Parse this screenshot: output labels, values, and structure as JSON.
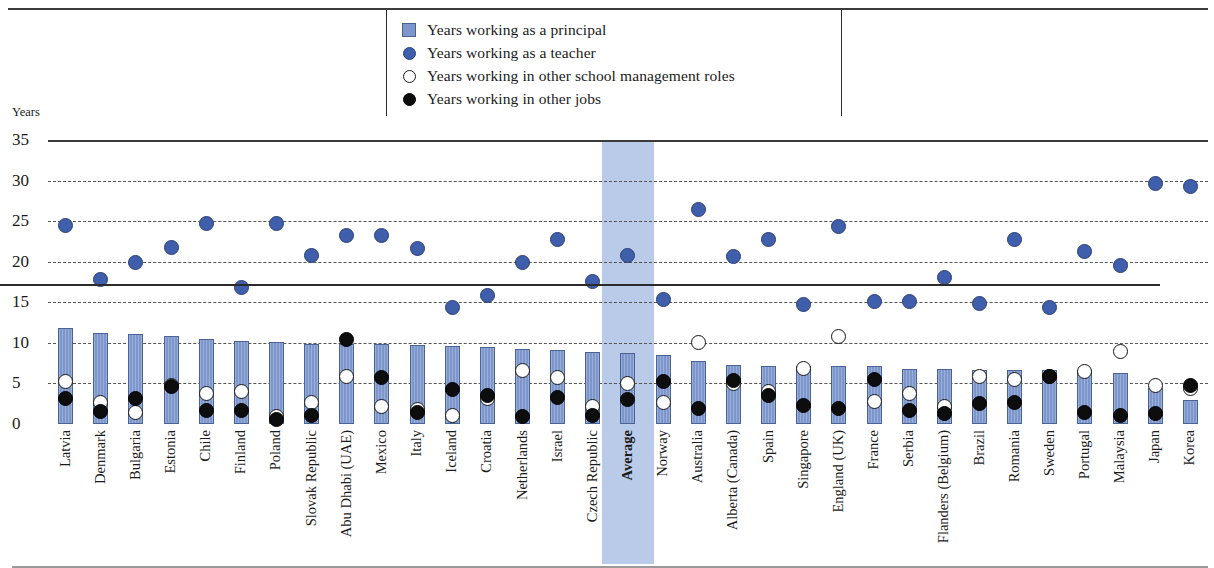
{
  "axis": {
    "unit_label": "Years",
    "ticks": [
      "35",
      "30",
      "25",
      "20",
      "15",
      "10",
      "5",
      "0"
    ]
  },
  "legend": {
    "items": [
      {
        "marker": "square-blue-icon",
        "label": "Years working as a principal"
      },
      {
        "marker": "circle-blue-icon",
        "label": "Years working as a teacher"
      },
      {
        "marker": "circle-open-icon",
        "label": "Years working in other school management roles"
      },
      {
        "marker": "circle-filled-icon",
        "label": "Years working in other jobs"
      }
    ]
  },
  "colors": {
    "bar": "#7d97cd",
    "bar_border": "#4a6397",
    "teacher": "#3f5fac",
    "management": "#ffffff",
    "other_jobs": "#0d0d0d",
    "average_band": "#b9cbe8"
  },
  "chart_data": {
    "type": "bar",
    "title": "",
    "xlabel": "",
    "ylabel": "Years",
    "ylim": [
      0,
      35
    ],
    "yticks": [
      0,
      5,
      10,
      15,
      20,
      25,
      30,
      35
    ],
    "grid": true,
    "legend_position": "top-center",
    "highlight_category": "Average",
    "categories": [
      "Latvia",
      "Denmark",
      "Bulgaria",
      "Estonia",
      "Chile",
      "Finland",
      "Poland",
      "Slovak Republic",
      "Abu Dhabi (UAE)",
      "Mexico",
      "Italy",
      "Iceland",
      "Croatia",
      "Netherlands",
      "Israel",
      "Czech Republic",
      "Average",
      "Norway",
      "Australia",
      "Alberta (Canada)",
      "Spain",
      "Singapore",
      "England (UK)",
      "France",
      "Serbia",
      "Flanders (Belgium)",
      "Brazil",
      "Romania",
      "Sweden",
      "Portugal",
      "Malaysia",
      "Japan",
      "Korea"
    ],
    "series": [
      {
        "name": "Years working as a principal",
        "type": "bar",
        "values": [
          11.8,
          11.2,
          11.1,
          10.8,
          10.5,
          10.2,
          10.1,
          9.9,
          9.8,
          9.8,
          9.7,
          9.6,
          9.5,
          9.2,
          9.1,
          8.9,
          8.7,
          8.5,
          7.8,
          7.3,
          7.2,
          7.2,
          7.2,
          7.1,
          6.8,
          6.8,
          6.7,
          6.7,
          6.7,
          6.6,
          6.3,
          4.5,
          3.0
        ]
      },
      {
        "name": "Years working as a teacher",
        "type": "scatter",
        "values": [
          24.5,
          17.8,
          19.9,
          21.7,
          24.7,
          16.8,
          24.7,
          20.8,
          23.2,
          23.2,
          21.6,
          14.3,
          15.8,
          19.9,
          22.7,
          17.6,
          20.8,
          15.3,
          26.4,
          20.7,
          22.7,
          14.7,
          24.4,
          15.1,
          15.1,
          18.1,
          14.9,
          22.7,
          14.4,
          21.3,
          19.5,
          29.7,
          29.3
        ]
      },
      {
        "name": "Years working in other school management roles",
        "type": "scatter",
        "values": [
          5.2,
          2.6,
          1.4,
          4.8,
          3.8,
          4.0,
          0.9,
          2.6,
          5.8,
          2.1,
          1.8,
          1.1,
          3.2,
          6.6,
          5.7,
          2.1,
          5.0,
          2.7,
          10.0,
          5.0,
          4.0,
          6.8,
          10.8,
          2.8,
          3.8,
          2.1,
          5.8,
          5.5,
          5.8,
          6.5,
          8.9,
          4.7,
          4.4
        ]
      },
      {
        "name": "Years working in other jobs",
        "type": "scatter",
        "values": [
          3.2,
          1.6,
          3.1,
          4.6,
          1.7,
          1.7,
          0.5,
          1.0,
          10.4,
          5.7,
          1.4,
          4.3,
          3.5,
          0.9,
          3.3,
          1.0,
          3.0,
          5.2,
          1.9,
          5.3,
          3.5,
          2.3,
          1.9,
          5.5,
          1.7,
          1.3,
          2.5,
          2.6,
          5.9,
          1.4,
          1.1,
          1.3,
          4.7
        ]
      }
    ]
  }
}
